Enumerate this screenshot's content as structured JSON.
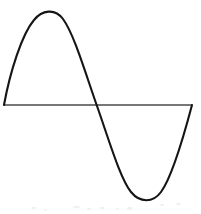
{
  "figure": {
    "background_color": "#ffffff",
    "width": 201,
    "height": 214,
    "caption_text": ""
  },
  "axis": {
    "name": "horizontal-axis-line",
    "color": "#4a4a4a",
    "stroke_width": 1.5,
    "y": 105,
    "x_start": 4,
    "x_end": 192
  },
  "curve": {
    "name": "sine-curve",
    "color": "#151515",
    "stroke_width": 2.1,
    "x_start": 4,
    "x_end": 192,
    "baseline_y": 105,
    "peak": {
      "x": 48,
      "y": 9
    },
    "zero_crossing": {
      "x": 97,
      "y": 106
    },
    "trough": {
      "x": 148,
      "y": 200
    },
    "amplitude_up": 96,
    "amplitude_down": 95,
    "path": "M 4 105 C 10 72 22 34 34 20 C 42 10 55 8 63 19 C 74 34 85 72 97 106 C 109 140 120 178 131 192 C 140 203 153 203 161 192 C 172 177 183 139 192 105"
  },
  "chart_data": {
    "type": "line",
    "subtitle": "",
    "xlabel": "",
    "ylabel": "",
    "grid": false,
    "legend_position": "none",
    "xlim": [
      0,
      360
    ],
    "ylim": [
      -1,
      1
    ],
    "series": [
      {
        "name": "sine",
        "x": [
          0,
          15,
          30,
          45,
          60,
          75,
          90,
          105,
          120,
          135,
          150,
          165,
          180,
          195,
          210,
          225,
          240,
          255,
          270,
          285,
          300,
          315,
          330,
          345,
          360
        ],
        "values": [
          0,
          0.259,
          0.5,
          0.707,
          0.866,
          0.966,
          1.0,
          0.966,
          0.866,
          0.707,
          0.5,
          0.259,
          0.0,
          -0.259,
          -0.5,
          -0.707,
          -0.866,
          -0.966,
          -1.0,
          -0.966,
          -0.866,
          -0.707,
          -0.5,
          -0.259,
          0
        ]
      },
      {
        "name": "zero-axis",
        "x": [
          0,
          360
        ],
        "values": [
          0,
          0
        ]
      }
    ],
    "annotations": []
  },
  "speckles": [
    {
      "left": 31,
      "top": 207,
      "w": 5,
      "h": 2
    },
    {
      "left": 44,
      "top": 209,
      "w": 3,
      "h": 2
    },
    {
      "left": 73,
      "top": 206,
      "w": 7,
      "h": 2
    },
    {
      "left": 87,
      "top": 208,
      "w": 4,
      "h": 2
    },
    {
      "left": 99,
      "top": 207,
      "w": 6,
      "h": 2
    },
    {
      "left": 116,
      "top": 208,
      "w": 3,
      "h": 2
    },
    {
      "left": 127,
      "top": 207,
      "w": 5,
      "h": 3
    },
    {
      "left": 160,
      "top": 204,
      "w": 4,
      "h": 2
    },
    {
      "left": 176,
      "top": 203,
      "w": 5,
      "h": 2
    }
  ]
}
